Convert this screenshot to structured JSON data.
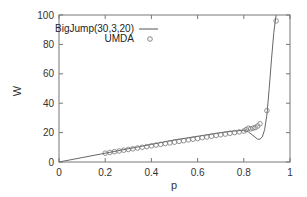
{
  "chart_data": {
    "type": "line",
    "title": "",
    "xlabel": "p",
    "ylabel": "W",
    "xlim": [
      0,
      1
    ],
    "ylim": [
      0,
      100
    ],
    "xticks": [
      0,
      0.2,
      0.4,
      0.6,
      0.8,
      1
    ],
    "xtick_labels": [
      "0",
      "0.2",
      "0.4",
      "0.6",
      "0.8",
      "1"
    ],
    "yticks": [
      0,
      20,
      40,
      60,
      80,
      100
    ],
    "ytick_labels": [
      "0",
      "20",
      "40",
      "60",
      "80",
      "100"
    ],
    "grid": false,
    "legend_position": "top-left",
    "series": [
      {
        "name": "BigJump(30,3,20)",
        "style": "line",
        "color": "#555555",
        "x": [
          0,
          0.1,
          0.2,
          0.3,
          0.4,
          0.5,
          0.6,
          0.7,
          0.75,
          0.8,
          0.82,
          0.84,
          0.86,
          0.87,
          0.88,
          0.89,
          0.9,
          0.91,
          0.92,
          0.93,
          0.94
        ],
        "y": [
          0,
          3,
          6,
          9,
          12,
          15,
          17.5,
          20,
          21,
          21.5,
          20.5,
          18,
          15.5,
          15.5,
          17,
          22,
          32,
          50,
          70,
          88,
          100
        ]
      },
      {
        "name": "UMDA",
        "style": "markers",
        "marker": "open-circle",
        "color": "#555555",
        "x": [
          0.2,
          0.22,
          0.24,
          0.26,
          0.28,
          0.3,
          0.32,
          0.34,
          0.36,
          0.38,
          0.4,
          0.42,
          0.44,
          0.46,
          0.48,
          0.5,
          0.52,
          0.54,
          0.56,
          0.58,
          0.6,
          0.62,
          0.64,
          0.66,
          0.68,
          0.7,
          0.72,
          0.74,
          0.76,
          0.78,
          0.8,
          0.81,
          0.82,
          0.83,
          0.84,
          0.85,
          0.86,
          0.87,
          0.9,
          0.94
        ],
        "y": [
          6,
          6.5,
          7,
          7.5,
          8,
          8.5,
          9,
          9.5,
          10,
          10.5,
          11,
          11.5,
          12,
          12.5,
          13,
          13.5,
          14,
          14.5,
          15,
          15.5,
          16,
          16.5,
          17,
          17.5,
          18,
          18.5,
          19,
          19.5,
          20,
          20.5,
          21,
          22,
          23,
          22.5,
          23,
          23.5,
          24.5,
          26,
          35,
          96
        ]
      }
    ]
  },
  "legend": {
    "items": [
      {
        "label": "BigJump(30,3,20)",
        "symbol": "line"
      },
      {
        "label": "UMDA",
        "symbol": "open-circle"
      }
    ]
  }
}
